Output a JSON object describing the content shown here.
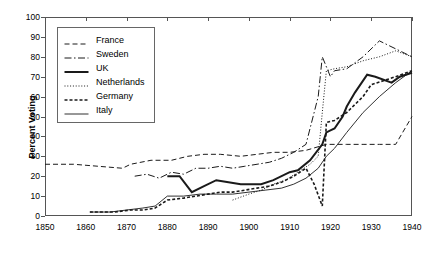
{
  "chart_data": {
    "type": "line",
    "title": "",
    "xlabel": "",
    "ylabel": "Percent Voting",
    "xlim": [
      1850,
      1940
    ],
    "ylim": [
      0,
      100
    ],
    "grid": false,
    "legend_position": "top-left",
    "xticks": [
      1850,
      1860,
      1870,
      1880,
      1890,
      1900,
      1910,
      1920,
      1930,
      1940
    ],
    "yticks": [
      0,
      10,
      20,
      30,
      40,
      50,
      60,
      70,
      80,
      90,
      100
    ],
    "series": [
      {
        "name": "France",
        "style": "dashed",
        "points": [
          [
            1850,
            26
          ],
          [
            1857,
            26
          ],
          [
            1863,
            25
          ],
          [
            1869,
            24
          ],
          [
            1871,
            26
          ],
          [
            1876,
            28
          ],
          [
            1881,
            28
          ],
          [
            1885,
            30
          ],
          [
            1889,
            31
          ],
          [
            1893,
            31
          ],
          [
            1898,
            30
          ],
          [
            1902,
            31
          ],
          [
            1906,
            32
          ],
          [
            1910,
            32
          ],
          [
            1914,
            33
          ],
          [
            1919,
            36
          ],
          [
            1924,
            36
          ],
          [
            1928,
            36
          ],
          [
            1932,
            36
          ],
          [
            1936,
            36
          ],
          [
            1940,
            50
          ]
        ]
      },
      {
        "name": "Sweden",
        "style": "dash-dot",
        "points": [
          [
            1872,
            20
          ],
          [
            1875,
            21
          ],
          [
            1878,
            19
          ],
          [
            1881,
            22
          ],
          [
            1884,
            21
          ],
          [
            1887,
            24
          ],
          [
            1890,
            24
          ],
          [
            1893,
            25
          ],
          [
            1896,
            24
          ],
          [
            1899,
            25
          ],
          [
            1902,
            26
          ],
          [
            1905,
            27
          ],
          [
            1908,
            29
          ],
          [
            1911,
            32
          ],
          [
            1914,
            36
          ],
          [
            1917,
            60
          ],
          [
            1918,
            80
          ],
          [
            1920,
            70
          ],
          [
            1921,
            73
          ],
          [
            1924,
            74
          ],
          [
            1928,
            80
          ],
          [
            1932,
            88
          ],
          [
            1936,
            84
          ],
          [
            1940,
            80
          ]
        ]
      },
      {
        "name": "UK",
        "style": "solid-bold",
        "points": [
          [
            1880,
            20
          ],
          [
            1883,
            20
          ],
          [
            1886,
            12
          ],
          [
            1889,
            15
          ],
          [
            1892,
            18
          ],
          [
            1895,
            17
          ],
          [
            1898,
            16
          ],
          [
            1900,
            16
          ],
          [
            1903,
            16
          ],
          [
            1906,
            18
          ],
          [
            1910,
            22
          ],
          [
            1912,
            23
          ],
          [
            1915,
            28
          ],
          [
            1918,
            36
          ],
          [
            1919,
            42
          ],
          [
            1920,
            43
          ],
          [
            1921,
            44
          ],
          [
            1923,
            50
          ],
          [
            1924,
            55
          ],
          [
            1926,
            62
          ],
          [
            1929,
            71
          ],
          [
            1931,
            70
          ],
          [
            1935,
            67
          ],
          [
            1937,
            70
          ],
          [
            1940,
            72
          ]
        ]
      },
      {
        "name": "Netherlands",
        "style": "dotted",
        "points": [
          [
            1896,
            8
          ],
          [
            1900,
            11
          ],
          [
            1903,
            13
          ],
          [
            1906,
            16
          ],
          [
            1909,
            18
          ],
          [
            1912,
            22
          ],
          [
            1915,
            26
          ],
          [
            1917,
            30
          ],
          [
            1918,
            52
          ],
          [
            1919,
            73
          ],
          [
            1921,
            74
          ],
          [
            1924,
            75
          ],
          [
            1928,
            78
          ],
          [
            1932,
            80
          ],
          [
            1936,
            83
          ],
          [
            1940,
            80
          ]
        ]
      },
      {
        "name": "Germany",
        "style": "dense-dash",
        "points": [
          [
            1861,
            2
          ],
          [
            1867,
            2
          ],
          [
            1871,
            3
          ],
          [
            1874,
            3
          ],
          [
            1877,
            4
          ],
          [
            1880,
            8
          ],
          [
            1884,
            9
          ],
          [
            1887,
            10
          ],
          [
            1890,
            11
          ],
          [
            1893,
            12
          ],
          [
            1896,
            12
          ],
          [
            1899,
            13
          ],
          [
            1902,
            14
          ],
          [
            1905,
            15
          ],
          [
            1908,
            17
          ],
          [
            1911,
            20
          ],
          [
            1914,
            24
          ],
          [
            1916,
            16
          ],
          [
            1918,
            5
          ],
          [
            1919,
            47
          ],
          [
            1921,
            48
          ],
          [
            1924,
            52
          ],
          [
            1928,
            60
          ],
          [
            1930,
            66
          ],
          [
            1933,
            68
          ],
          [
            1936,
            70
          ],
          [
            1940,
            73
          ]
        ]
      },
      {
        "name": "Italy",
        "style": "thin-solid",
        "points": [
          [
            1861,
            2
          ],
          [
            1866,
            2
          ],
          [
            1870,
            3
          ],
          [
            1874,
            4
          ],
          [
            1877,
            5
          ],
          [
            1880,
            10
          ],
          [
            1884,
            10
          ],
          [
            1888,
            11
          ],
          [
            1892,
            11
          ],
          [
            1896,
            11
          ],
          [
            1900,
            12
          ],
          [
            1904,
            13
          ],
          [
            1908,
            14
          ],
          [
            1911,
            16
          ],
          [
            1914,
            19
          ],
          [
            1917,
            24
          ],
          [
            1919,
            30
          ],
          [
            1921,
            34
          ],
          [
            1924,
            42
          ],
          [
            1928,
            52
          ],
          [
            1932,
            60
          ],
          [
            1936,
            67
          ],
          [
            1940,
            73
          ]
        ]
      }
    ]
  },
  "legend": {
    "entries": [
      {
        "label": "France"
      },
      {
        "label": "Sweden"
      },
      {
        "label": "UK"
      },
      {
        "label": "Netherlands"
      },
      {
        "label": "Germany"
      },
      {
        "label": "Italy"
      }
    ]
  },
  "colors": {
    "line": "#1a1a1a",
    "frame": "#555555",
    "background": "#ffffff"
  }
}
